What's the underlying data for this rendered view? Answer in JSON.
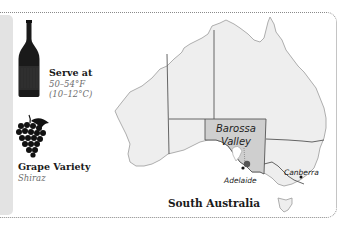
{
  "wine_card": {
    "serve": {
      "label": "Serve at",
      "temp_f": "50–54°F",
      "temp_c": "(10–12°C)",
      "icon": "wine-bottle-icon"
    },
    "grape": {
      "label": "Grape Variety",
      "value": "Shiraz",
      "icon": "grape-cluster-icon"
    },
    "map": {
      "region_title": "South Australia",
      "highlight_label_line1": "Barossa",
      "highlight_label_line2": "Valley",
      "cities": [
        "Adelaide",
        "Canberra"
      ],
      "colors": {
        "land": "#eeeeee",
        "highlight": "#cfcfcf",
        "border": "#555555",
        "coast": "#9a9a9a"
      }
    }
  }
}
